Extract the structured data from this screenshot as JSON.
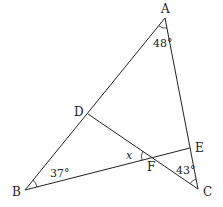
{
  "diagram": {
    "type": "geometry",
    "points": {
      "A": {
        "label": "A",
        "x": 165,
        "y": 18
      },
      "B": {
        "label": "B",
        "x": 25,
        "y": 190
      },
      "C": {
        "label": "C",
        "x": 198,
        "y": 189
      },
      "D": {
        "label": "D",
        "x": 88,
        "y": 114
      },
      "E": {
        "label": "E",
        "x": 190,
        "y": 148
      },
      "F": {
        "label": "F",
        "x": 152,
        "y": 157
      }
    },
    "segments": [
      "AB",
      "AC",
      "BE",
      "DC"
    ],
    "angles": {
      "A": "48°",
      "B": "37°",
      "C": "43°",
      "x": "x"
    }
  }
}
